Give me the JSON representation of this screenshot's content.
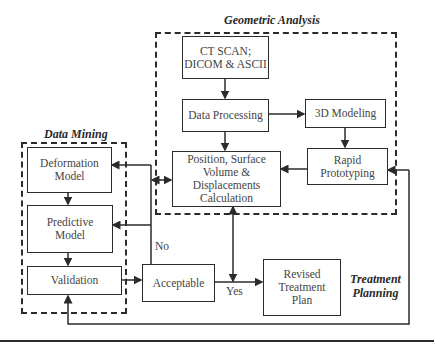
{
  "groups": {
    "geometric": {
      "title": "Geometric Analysis"
    },
    "mining": {
      "title": "Data Mining"
    },
    "treatment": {
      "title_line1": "Treatment",
      "title_line2": "Planning"
    }
  },
  "nodes": {
    "ct": {
      "line1": "CT SCAN;",
      "line2": "DICOM & ASCII"
    },
    "processing": {
      "label": "Data Processing"
    },
    "modeling": {
      "label": "3D Modeling"
    },
    "prototyping": {
      "line1": "Rapid",
      "line2": "Prototyping"
    },
    "position": {
      "line1": "Position, Surface",
      "line2": "Volume &",
      "line3": "Displacements",
      "line4": "Calculation"
    },
    "deformation": {
      "line1": "Deformation",
      "line2": "Model"
    },
    "predictive": {
      "line1": "Predictive",
      "line2": "Model"
    },
    "validation": {
      "label": "Validation"
    },
    "acceptable": {
      "label": "Acceptable"
    },
    "revised": {
      "line1": "Revised",
      "line2": "Treatment",
      "line3": "Plan"
    }
  },
  "edge_labels": {
    "no": "No",
    "yes": "Yes"
  },
  "colors": {
    "stroke": "#2b2b2b",
    "text": "#444444",
    "background": "#ffffff"
  }
}
